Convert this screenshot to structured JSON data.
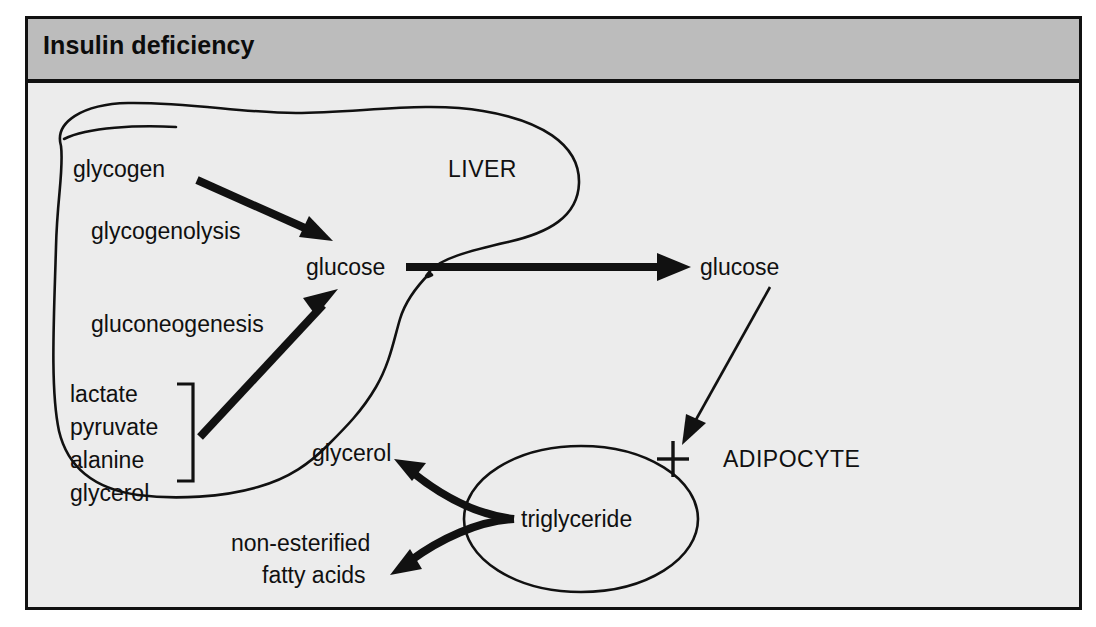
{
  "figure": {
    "title": "Insulin deficiency",
    "title_bar_color": "#bcbcbc",
    "background_color": "#ececec",
    "border_color": "#111111",
    "ink_color": "#111111"
  },
  "compartments": {
    "liver_label": "LIVER",
    "adipocyte_label": "ADIPOCYTE"
  },
  "liver": {
    "metabolites": {
      "glycogen": "glycogen",
      "glucose": "glucose"
    },
    "pathways": {
      "glycogenolysis": "glycogenolysis",
      "gluconeogenesis": "gluconeogenesis"
    },
    "substrates": [
      "lactate",
      "pyruvate",
      "alanine",
      "glycerol"
    ]
  },
  "circulation": {
    "glucose": "glucose"
  },
  "adipocyte": {
    "triglyceride": "triglyceride",
    "products": {
      "glycerol": "glycerol",
      "nefa_line1": "non-esterified",
      "nefa_line2": "fatty acids"
    },
    "inhibition_marker": "cross"
  },
  "icons": {
    "glycogenolysis_arrow": "thick-arrow-down-right-icon",
    "gluconeogenesis_arrow": "thick-arrow-up-right-icon",
    "hepatic_output_arrow": "thick-arrow-right-icon",
    "glucose_uptake_arrow": "thin-arrow-down-left-icon",
    "uptake_block": "inhibition-cross-icon",
    "lipolysis_glycerol_arrow": "thick-curved-arrow-up-left-icon",
    "lipolysis_nefa_arrow": "thick-curved-arrow-down-left-icon",
    "substrate_bracket": "right-brace-icon",
    "liver_outline": "liver-shape-icon",
    "adipocyte_outline": "ellipse-icon"
  },
  "bleed_text": "insulin substitution\nthe a sulfonylurea\ninsulin or\nmore often a\nother hepatic\nated.\n\nover-activ\nHuman\nproteins de\ninsulin rece\ninsulin bin\nphosphoryl\nreceptor"
}
